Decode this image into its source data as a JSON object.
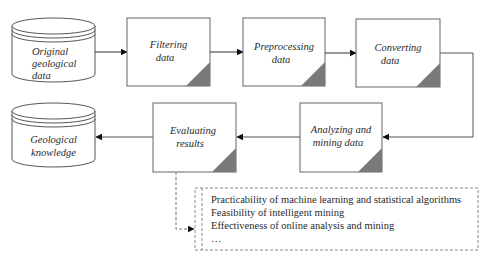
{
  "diagram": {
    "type": "flowchart",
    "colors": {
      "stroke": "#555555",
      "corner_fill": "#7a7a7a",
      "text": "#2a2a2a",
      "dashed": "#777777"
    },
    "nodes": [
      {
        "id": "original",
        "shape": "cylinder",
        "lines": [
          "Original",
          "geological",
          "data"
        ]
      },
      {
        "id": "filtering",
        "shape": "process-box",
        "lines": [
          "Filtering",
          "data"
        ]
      },
      {
        "id": "preprocessing",
        "shape": "process-box",
        "lines": [
          "Preprocessing",
          "data"
        ]
      },
      {
        "id": "converting",
        "shape": "process-box",
        "lines": [
          "Converting",
          "data"
        ]
      },
      {
        "id": "analyzing",
        "shape": "process-box",
        "lines": [
          "Analyzing and",
          "mining data"
        ]
      },
      {
        "id": "evaluating",
        "shape": "process-box",
        "lines": [
          "Evaluating",
          "results"
        ]
      },
      {
        "id": "knowledge",
        "shape": "cylinder",
        "lines": [
          "Geological",
          "knowledge"
        ]
      }
    ],
    "edges": [
      {
        "from": "original",
        "to": "filtering",
        "style": "solid"
      },
      {
        "from": "filtering",
        "to": "preprocessing",
        "style": "solid"
      },
      {
        "from": "preprocessing",
        "to": "converting",
        "style": "solid"
      },
      {
        "from": "converting",
        "to": "analyzing",
        "style": "solid"
      },
      {
        "from": "analyzing",
        "to": "evaluating",
        "style": "solid"
      },
      {
        "from": "evaluating",
        "to": "knowledge",
        "style": "solid"
      },
      {
        "from": "evaluating",
        "to": "criteria-note",
        "style": "dashed"
      }
    ],
    "note": {
      "id": "criteria-note",
      "items": [
        "Practicability of machine learning and statistical algorithms",
        "Feasibility of intelligent mining",
        "Effectiveness of online analysis and mining",
        "…"
      ]
    }
  }
}
